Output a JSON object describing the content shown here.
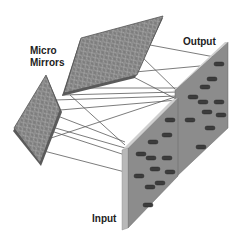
{
  "diagram": {
    "labels": {
      "micro_mirrors_line1": "Micro",
      "micro_mirrors_line2": "Mirrors",
      "output": "Output",
      "input": "Input"
    },
    "colors": {
      "panel_fill": "#8a8a8a",
      "panel_edge": "#c8c8c8",
      "mirror_fill": "#7a7a7a",
      "element_fill": "#3a3a3a",
      "ray_line": "#555555",
      "text": "#222222"
    }
  }
}
